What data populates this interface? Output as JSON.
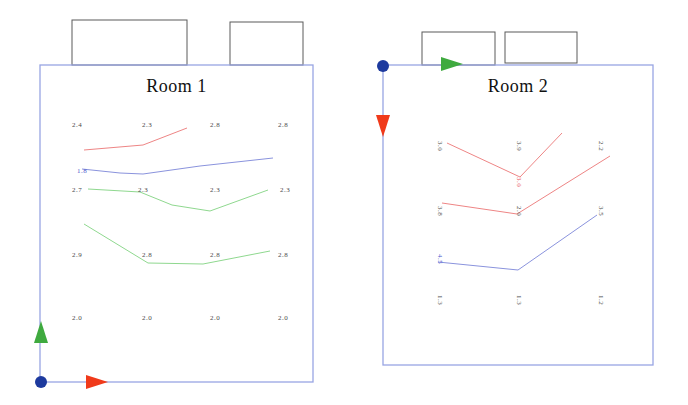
{
  "colors": {
    "background": "#ffffff",
    "wall": "#98a5e3",
    "box_stroke": "#5a5a5a",
    "text": "#4a4a4a",
    "red_line": "#ee8585",
    "blue_line": "#8a93dd",
    "green_line": "#8fd88f",
    "arrow_green": "#3faa3f",
    "arrow_red": "#f03a1a",
    "origin_dot": "#1d3a9e"
  },
  "rooms": [
    {
      "id": "room-1",
      "title": "Room 1",
      "rect": {
        "x": 40,
        "y": 65,
        "w": 273,
        "h": 317
      },
      "top_boxes": [
        {
          "x": 72,
          "y": 20,
          "w": 115,
          "h": 45
        },
        {
          "x": 230,
          "y": 22,
          "w": 73,
          "h": 43
        }
      ],
      "origin": {
        "x": 41,
        "y": 382
      },
      "arrows": [
        {
          "dir": "up",
          "x": 41,
          "y": 332,
          "color": "#3faa3f"
        },
        {
          "dir": "right",
          "x": 97,
          "y": 382,
          "color": "#f03a1a"
        }
      ],
      "labels": [
        {
          "value": "2.4",
          "x": 77,
          "y": 125
        },
        {
          "value": "2.3",
          "x": 147,
          "y": 125
        },
        {
          "value": "2.8",
          "x": 215,
          "y": 125
        },
        {
          "value": "2.8",
          "x": 283,
          "y": 125
        },
        {
          "value": "1.8",
          "x": 82,
          "y": 171,
          "color": "#4a55cc"
        },
        {
          "value": "2.7",
          "x": 77,
          "y": 190
        },
        {
          "value": "2.3",
          "x": 143,
          "y": 190
        },
        {
          "value": "2.3",
          "x": 215,
          "y": 190
        },
        {
          "value": "2.3",
          "x": 285,
          "y": 190
        },
        {
          "value": "2.9",
          "x": 77,
          "y": 255
        },
        {
          "value": "2.8",
          "x": 147,
          "y": 255
        },
        {
          "value": "2.8",
          "x": 215,
          "y": 255
        },
        {
          "value": "2.8",
          "x": 283,
          "y": 255
        },
        {
          "value": "2.0",
          "x": 77,
          "y": 318
        },
        {
          "value": "2.0",
          "x": 147,
          "y": 318
        },
        {
          "value": "2.0",
          "x": 215,
          "y": 318
        },
        {
          "value": "2.0",
          "x": 283,
          "y": 318
        }
      ],
      "lines": [
        {
          "name": "red-profile-line",
          "color": "#ee8585",
          "points": [
            [
              84,
              150
            ],
            [
              143,
              145
            ],
            [
              187,
              128
            ]
          ]
        },
        {
          "name": "blue-profile-line",
          "color": "#8a93dd",
          "points": [
            [
              82,
              169
            ],
            [
              120,
              173
            ],
            [
              143,
              174
            ],
            [
              200,
              166
            ],
            [
              273,
              158
            ]
          ]
        },
        {
          "name": "green-profile-line-upper",
          "color": "#8fd88f",
          "points": [
            [
              88,
              189
            ],
            [
              140,
              192
            ],
            [
              172,
              205
            ],
            [
              210,
              211
            ],
            [
              268,
              190
            ]
          ]
        },
        {
          "name": "green-profile-line-lower",
          "color": "#8fd88f",
          "points": [
            [
              84,
              224
            ],
            [
              148,
              263
            ],
            [
              203,
              264
            ],
            [
              270,
              251
            ]
          ]
        }
      ]
    },
    {
      "id": "room-2",
      "title": "Room 2",
      "rect": {
        "x": 383,
        "y": 65,
        "w": 270,
        "h": 300
      },
      "top_boxes": [
        {
          "x": 422,
          "y": 32,
          "w": 73,
          "h": 33
        },
        {
          "x": 505,
          "y": 32,
          "w": 72,
          "h": 31
        }
      ],
      "origin": {
        "x": 383,
        "y": 66
      },
      "arrows": [
        {
          "dir": "right",
          "x": 452,
          "y": 64,
          "color": "#3faa3f"
        },
        {
          "dir": "down",
          "x": 383,
          "y": 126,
          "color": "#f03a1a"
        }
      ],
      "labels": [
        {
          "value": "3.0",
          "x": 440,
          "y": 146,
          "rotated": true
        },
        {
          "value": "3.9",
          "x": 519,
          "y": 146,
          "rotated": true
        },
        {
          "value": "2.2",
          "x": 601,
          "y": 146,
          "rotated": true
        },
        {
          "value": "3.0",
          "x": 519,
          "y": 182,
          "rotated": true,
          "color": "#e84d5a"
        },
        {
          "value": "3.8",
          "x": 440,
          "y": 211,
          "rotated": true
        },
        {
          "value": "2.0",
          "x": 519,
          "y": 211,
          "rotated": true
        },
        {
          "value": "3.5",
          "x": 601,
          "y": 211,
          "rotated": true
        },
        {
          "value": "4.5",
          "x": 440,
          "y": 259,
          "rotated": true,
          "color": "#4a55cc"
        },
        {
          "value": "1.3",
          "x": 440,
          "y": 300,
          "rotated": true
        },
        {
          "value": "1.3",
          "x": 519,
          "y": 300,
          "rotated": true
        },
        {
          "value": "1.2",
          "x": 601,
          "y": 300,
          "rotated": true
        }
      ],
      "lines": [
        {
          "name": "red-profile-line-upper",
          "color": "#ee8585",
          "points": [
            [
              447,
              143
            ],
            [
              520,
              177
            ],
            [
              562,
              133
            ]
          ]
        },
        {
          "name": "red-profile-line-lower",
          "color": "#ee8585",
          "points": [
            [
              442,
              203
            ],
            [
              517,
              214
            ],
            [
              610,
              156
            ]
          ]
        },
        {
          "name": "blue-profile-line",
          "color": "#8a93dd",
          "points": [
            [
              438,
              262
            ],
            [
              518,
              270
            ],
            [
              597,
              215
            ]
          ]
        }
      ]
    }
  ]
}
